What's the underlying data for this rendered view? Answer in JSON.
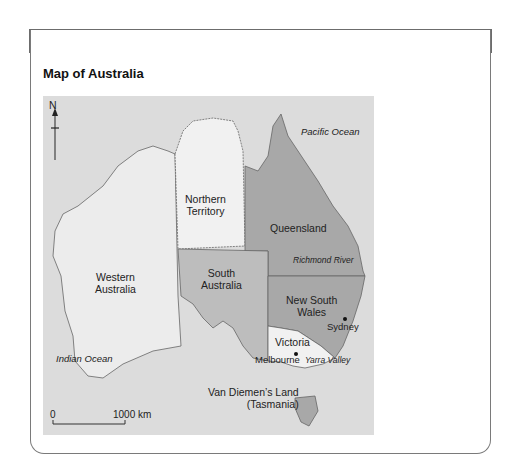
{
  "header": {
    "label": "Source",
    "number": "4.20"
  },
  "subtitle": "Map of Australia",
  "map": {
    "north_label": "N",
    "regions": [
      {
        "name": "Western Australia",
        "label_line1": "Western",
        "label_line2": "Australia",
        "fill": "#ececec"
      },
      {
        "name": "Northern Territory",
        "label_line1": "Northern",
        "label_line2": "Territory",
        "fill": "#f1f1f1"
      },
      {
        "name": "Queensland",
        "label_line1": "Queensland",
        "fill": "#a8a8a8"
      },
      {
        "name": "South Australia",
        "label_line1": "South",
        "label_line2": "Australia",
        "fill": "#bdbdbd"
      },
      {
        "name": "New South Wales",
        "label_line1": "New South",
        "label_line2": "Wales",
        "fill": "#a8a8a8"
      },
      {
        "name": "Victoria",
        "label_line1": "Victoria",
        "fill": "#f1f1f1"
      },
      {
        "name": "Van Diemen's Land (Tasmania)",
        "label_line1": "Van Diemen’s Land",
        "label_line2": "(Tasmania)",
        "fill": "#a8a8a8"
      }
    ],
    "oceans": {
      "pacific": "Pacific Ocean",
      "indian": "Indian Ocean"
    },
    "features": {
      "river": "Richmond River",
      "valley": "Yarra Valley"
    },
    "cities": {
      "sydney": "Sydney",
      "melbourne": "Melbourne"
    },
    "scale": {
      "start": "0",
      "end": "1000 km"
    }
  }
}
